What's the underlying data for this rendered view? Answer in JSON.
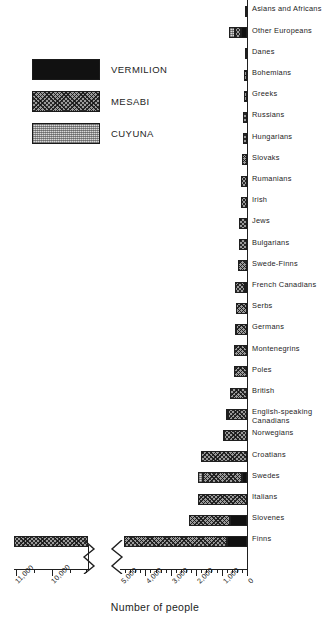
{
  "legend": {
    "title": "legend",
    "items": [
      {
        "label": "VERMILION",
        "pattern": "solid-black",
        "color": "#111111"
      },
      {
        "label": "MESABI",
        "pattern": "diagonal-crosshatch",
        "color": "#9a9a9a"
      },
      {
        "label": "CUYUNA",
        "pattern": "light-dotted",
        "color": "#d8d8d8"
      }
    ]
  },
  "axis": {
    "title": "Number of people",
    "tick_labels_main": [
      "5,000",
      "4,000",
      "3,000",
      "2,000",
      "1,000",
      "0"
    ],
    "tick_labels_break": [
      "11,000",
      "10,000"
    ],
    "direction": "right-to-left",
    "has_axis_break": true,
    "break_icon": "axis-break-zigzag"
  },
  "chart_data": {
    "type": "bar",
    "orientation": "horizontal",
    "title": "",
    "subtitle": "",
    "xlabel": "Number of people",
    "ylabel": "",
    "xlim": [
      0,
      5400
    ],
    "xlim_break_segment": [
      9600,
      11400
    ],
    "grid": false,
    "legend_position": "top-left",
    "stacked": true,
    "series": [
      {
        "name": "VERMILION",
        "color": "#111111"
      },
      {
        "name": "MESABI",
        "color": "#9a9a9a"
      },
      {
        "name": "CUYUNA",
        "color": "#d8d8d8"
      }
    ],
    "categories": [
      "Asians and Africans",
      "Other Europeans",
      "Danes",
      "Bohemians",
      "Greeks",
      "Russians",
      "Hungarians",
      "Slovaks",
      "Rumanians",
      "Irish",
      "Jews",
      "Bulgarians",
      "Swede-Finns",
      "French Canadians",
      "Serbs",
      "Germans",
      "Montenegrins",
      "Poles",
      "British",
      "English-speaking Canadians",
      "Norwegians",
      "Croatians",
      "Swedes",
      "Italians",
      "Slovenes",
      "Finns"
    ],
    "rows": [
      {
        "category": "Asians and Africans",
        "vermilion": 0,
        "mesabi": 60,
        "cuyuna": 0,
        "total": 60
      },
      {
        "category": "Other Europeans",
        "vermilion": 230,
        "mesabi": 250,
        "cuyuna": 230,
        "total": 710
      },
      {
        "category": "Danes",
        "vermilion": 0,
        "mesabi": 90,
        "cuyuna": 0,
        "total": 90
      },
      {
        "category": "Bohemians",
        "vermilion": 0,
        "mesabi": 105,
        "cuyuna": 0,
        "total": 105
      },
      {
        "category": "Greeks",
        "vermilion": 0,
        "mesabi": 115,
        "cuyuna": 0,
        "total": 115
      },
      {
        "category": "Russians",
        "vermilion": 0,
        "mesabi": 150,
        "cuyuna": 0,
        "total": 150
      },
      {
        "category": "Hungarians",
        "vermilion": 0,
        "mesabi": 175,
        "cuyuna": 0,
        "total": 175
      },
      {
        "category": "Slovaks",
        "vermilion": 0,
        "mesabi": 205,
        "cuyuna": 0,
        "total": 205
      },
      {
        "category": "Rumanians",
        "vermilion": 0,
        "mesabi": 225,
        "cuyuna": 0,
        "total": 225
      },
      {
        "category": "Irish",
        "vermilion": 0,
        "mesabi": 240,
        "cuyuna": 0,
        "total": 240
      },
      {
        "category": "Jews",
        "vermilion": 0,
        "mesabi": 300,
        "cuyuna": 0,
        "total": 300
      },
      {
        "category": "Bulgarians",
        "vermilion": 0,
        "mesabi": 330,
        "cuyuna": 0,
        "total": 330
      },
      {
        "category": "Swede-Finns",
        "vermilion": 0,
        "mesabi": 345,
        "cuyuna": 0,
        "total": 345
      },
      {
        "category": "French Canadians",
        "vermilion": 70,
        "mesabi": 400,
        "cuyuna": 0,
        "total": 470
      },
      {
        "category": "Serbs",
        "vermilion": 0,
        "mesabi": 430,
        "cuyuna": 0,
        "total": 430
      },
      {
        "category": "Germans",
        "vermilion": 0,
        "mesabi": 430,
        "cuyuna": 60,
        "total": 490
      },
      {
        "category": "Montenegrins",
        "vermilion": 0,
        "mesabi": 505,
        "cuyuna": 0,
        "total": 505
      },
      {
        "category": "Poles",
        "vermilion": 0,
        "mesabi": 520,
        "cuyuna": 0,
        "total": 520
      },
      {
        "category": "British",
        "vermilion": 0,
        "mesabi": 650,
        "cuyuna": 0,
        "total": 650
      },
      {
        "category": "English-speaking Canadians",
        "vermilion": 0,
        "mesabi": 740,
        "cuyuna": 80,
        "total": 820
      },
      {
        "category": "Norwegians",
        "vermilion": 0,
        "mesabi": 890,
        "cuyuna": 60,
        "total": 950
      },
      {
        "category": "Croatians",
        "vermilion": 0,
        "mesabi": 1830,
        "cuyuna": 0,
        "total": 1830
      },
      {
        "category": "Swedes",
        "vermilion": 200,
        "mesabi": 1520,
        "cuyuna": 190,
        "total": 1910
      },
      {
        "category": "Italians",
        "vermilion": 0,
        "mesabi": 1940,
        "cuyuna": 0,
        "total": 1940
      },
      {
        "category": "Slovenes",
        "vermilion": 680,
        "mesabi": 1600,
        "cuyuna": 0,
        "total": 2280
      },
      {
        "category": "Finns",
        "vermilion": 800,
        "mesabi": 10400,
        "cuyuna": 0,
        "total": 11200
      }
    ]
  }
}
